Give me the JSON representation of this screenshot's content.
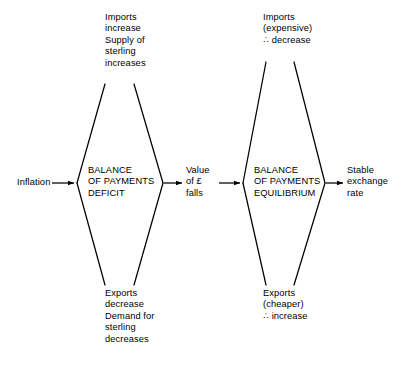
{
  "diagram": {
    "stroke_color": "#000000",
    "background_color": "#ffffff",
    "text_color": "#000000"
  },
  "left_branch": {
    "input_label": "Inflation",
    "top_note": "Imports\nincrease\nSupply of\nsterling\nincreases",
    "bottom_note": "Exports\ndecrease\nDemand for\nsterling\ndecreases",
    "center_label": "BALANCE\nOF PAYMENTS\nDEFICIT",
    "output_label": "Value\nof £\nfalls"
  },
  "right_branch": {
    "input_label": "Value\nof £\nfalls",
    "top_note": "Imports\n(expensive)\n∴ decrease",
    "bottom_note": "Exports\n(cheaper)\n∴ increase",
    "center_label": "BALANCE\nOF PAYMENTS\nEQUILIBRIUM",
    "output_label": "Stable\nexchange\nrate"
  }
}
